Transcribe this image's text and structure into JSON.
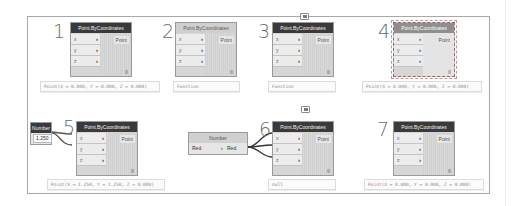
{
  "states": [
    {
      "number": "1",
      "title": "Point.ByCoordinates",
      "style": "active",
      "inputs": [
        "x",
        "y",
        "z"
      ],
      "output": "Point",
      "lacing": "|||",
      "preview": "Point(X = 0.000, Y = 0.000, Z = 0.000)"
    },
    {
      "number": "2",
      "title": "Point.ByCoordinates",
      "style": "inactive",
      "inputs": [
        "x",
        "y",
        "z"
      ],
      "output": "Point",
      "lacing": "|||",
      "preview": "Function"
    },
    {
      "number": "3",
      "title": "Point.ByCoordinates",
      "style": "warning",
      "inputs": [
        "x",
        "y",
        "z"
      ],
      "output": "Point",
      "lacing": "|||",
      "preview": "Function",
      "icon": "warning-bubble-icon"
    },
    {
      "number": "4",
      "title": "Point.ByCoordinates",
      "style": "selected",
      "inputs": [
        "x",
        "y",
        "z"
      ],
      "output": "Point",
      "lacing": "|||",
      "preview": "Point(X = 0.000, Y = 0.000, Z = 0.000)"
    },
    {
      "number": "5",
      "title": "Point.ByCoordinates",
      "style": "active",
      "inputs": [
        "x",
        "y",
        "z"
      ],
      "output": "Point",
      "lacing": "|||",
      "preview": "Point(X = 1.250, Y = 1.250, Z = 0.000)",
      "input_node": {
        "title": "Number",
        "value": "1.250",
        "arrow": ">"
      }
    },
    {
      "number": "6",
      "title": "Point.ByCoordinates",
      "style": "active",
      "inputs": [
        "x",
        "y",
        "z"
      ],
      "output": "Point",
      "lacing": "|||",
      "preview": "null",
      "icon": "warning-bubble-icon",
      "input_node": {
        "title": "Number",
        "label": "Red",
        "value": "Red",
        "arrow": ">"
      }
    },
    {
      "number": "7",
      "title": "Point.ByCoordinates",
      "style": "active",
      "inputs": [
        "x",
        "y",
        "z"
      ],
      "output": "Point",
      "lacing": "|||",
      "preview": "Point(X = 0.000, Y = 0.000, Z = 0.000)"
    }
  ]
}
